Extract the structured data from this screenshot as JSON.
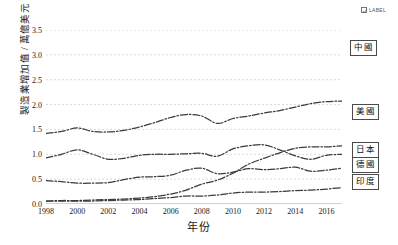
{
  "legend_chip": {
    "icon": "checkbox-checked-icon",
    "label": "LABEL"
  },
  "chart_data": {
    "type": "line",
    "title": "",
    "subtitle": "",
    "xlabel": "年份",
    "ylabel": "製造業增加值 / 萬億美元",
    "xlim": [
      1998,
      2017
    ],
    "ylim": [
      0.0,
      3.5
    ],
    "grid": true,
    "legend_position": "inline-right-callouts",
    "xtick_labels": [
      "1998",
      "2000",
      "2002",
      "2004",
      "2006",
      "2008",
      "2010",
      "2012",
      "2014",
      "2016"
    ],
    "xtick_values": [
      1998,
      2000,
      2002,
      2004,
      2006,
      2008,
      2010,
      2012,
      2014,
      2016
    ],
    "ytick_labels": [
      "0.0",
      "0.5",
      "1.0",
      "1.5",
      "2.0",
      "2.5",
      "3.0",
      "3.5"
    ],
    "ytick_values": [
      0.0,
      0.5,
      1.0,
      1.5,
      2.0,
      2.5,
      3.0,
      3.5
    ],
    "x": [
      1998,
      1999,
      2000,
      2001,
      2002,
      2003,
      2004,
      2005,
      2006,
      2007,
      2008,
      2009,
      2010,
      2011,
      2012,
      2013,
      2014,
      2015,
      2016,
      2017
    ],
    "series": [
      {
        "name": "中國",
        "label": "中國",
        "color": "#3b3b3b",
        "values": [
          0.06,
          0.07,
          0.07,
          0.08,
          0.09,
          0.1,
          0.12,
          0.15,
          0.2,
          0.28,
          0.4,
          0.48,
          0.62,
          0.8,
          0.92,
          1.03,
          1.12,
          1.15,
          1.15,
          1.17
        ]
      },
      {
        "name": "美國",
        "label": "美國",
        "color": "#3b3b3b",
        "values": [
          1.42,
          1.46,
          1.53,
          1.46,
          1.45,
          1.48,
          1.55,
          1.64,
          1.74,
          1.8,
          1.77,
          1.62,
          1.72,
          1.77,
          1.83,
          1.88,
          1.95,
          2.02,
          2.06,
          2.07
        ]
      },
      {
        "name": "日本",
        "label": "日本",
        "color": "#3b3b3b",
        "values": [
          0.93,
          1.0,
          1.09,
          1.0,
          0.9,
          0.92,
          0.98,
          1.0,
          1.0,
          1.01,
          1.02,
          0.96,
          1.11,
          1.17,
          1.19,
          1.09,
          0.97,
          0.9,
          0.98,
          1.0
        ]
      },
      {
        "name": "德國",
        "label": "德國",
        "color": "#3b3b3b",
        "values": [
          0.47,
          0.45,
          0.42,
          0.42,
          0.43,
          0.49,
          0.54,
          0.55,
          0.58,
          0.68,
          0.72,
          0.61,
          0.64,
          0.71,
          0.69,
          0.71,
          0.74,
          0.66,
          0.68,
          0.72
        ]
      },
      {
        "name": "印度",
        "label": "印度",
        "color": "#3b3b3b",
        "values": [
          0.06,
          0.06,
          0.06,
          0.06,
          0.07,
          0.08,
          0.09,
          0.11,
          0.13,
          0.16,
          0.16,
          0.18,
          0.22,
          0.24,
          0.24,
          0.25,
          0.27,
          0.28,
          0.3,
          0.33
        ]
      }
    ],
    "callouts": [
      {
        "name": "中國",
        "x_px": 350,
        "y_px": 40
      },
      {
        "name": "美國",
        "x_px": 352,
        "y_px": 104
      },
      {
        "name": "日本",
        "x_px": 352,
        "y_px": 142
      },
      {
        "name": "德國",
        "x_px": 352,
        "y_px": 157
      },
      {
        "name": "印度",
        "x_px": 352,
        "y_px": 174
      }
    ]
  }
}
